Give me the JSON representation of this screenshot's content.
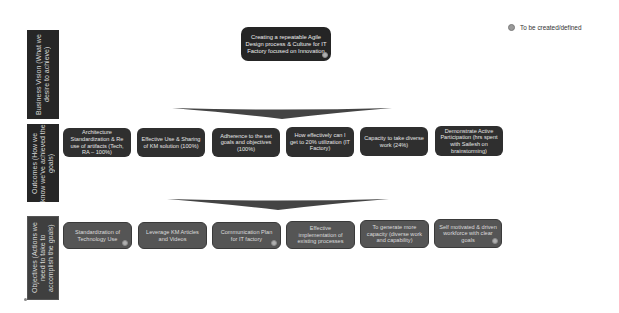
{
  "legend": {
    "label": "To be created/defined",
    "dot_color": "#9a9a9a"
  },
  "bands": [
    {
      "label": "Business Vision (What we desire to achieve)"
    },
    {
      "label": "Outcomes (How we know we've achieved the goals)"
    },
    {
      "label": "Objectives (Actions we need to take to accomplish the goals)"
    }
  ],
  "vision": {
    "text": "Creating a repeatable Agile Design process & Culture for IT Factory focused on Innovation",
    "to_be_defined": true
  },
  "outcomes": [
    {
      "text": "Architecture Standardization & Re use of artifacts (Tech, RA – 100%)"
    },
    {
      "text": "Effective Use & Sharing of KM solution (100%)"
    },
    {
      "text": "Adherence to the set goals and objectives (100%)"
    },
    {
      "text": "How effectively can I get to 20% utilization (IT Factory)"
    },
    {
      "text": "Capacity to take diverse work (24%)"
    },
    {
      "text": "Demonstrate Active Participation (hrs spent with Sailesh on brainstorming)"
    }
  ],
  "objectives": [
    {
      "text": "Standardization of Technology Use",
      "to_be_defined": true
    },
    {
      "text": "Leverage KM Articles and Videos",
      "to_be_defined": false
    },
    {
      "text": "Communication Plan for IT factory",
      "to_be_defined": true
    },
    {
      "text": "Effective implementation of existing processes",
      "to_be_defined": false
    },
    {
      "text": "To generate more capacity (diverse work and capability)",
      "to_be_defined": false
    },
    {
      "text": "Self motivated & driven workforce with clear goals",
      "to_be_defined": true
    }
  ],
  "colors": {
    "band_dark": "#262626",
    "band_mid": "#3f3f3f",
    "outcome_box": "#2f2f2f",
    "objective_box": "#555555",
    "arrow": "#444444"
  }
}
